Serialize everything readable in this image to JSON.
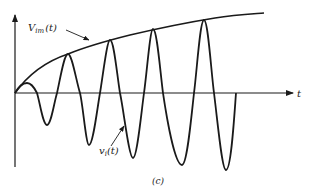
{
  "figure": {
    "caption": "(c)",
    "axis_label_t": "t",
    "envelope_label_main": "V",
    "envelope_label_sub": "im",
    "envelope_label_arg": "(t)",
    "signal_label_main": "v",
    "signal_label_sub": "i",
    "signal_label_arg": "(t)"
  },
  "colors": {
    "stroke": "#1a1a1a",
    "background": "#ffffff"
  }
}
